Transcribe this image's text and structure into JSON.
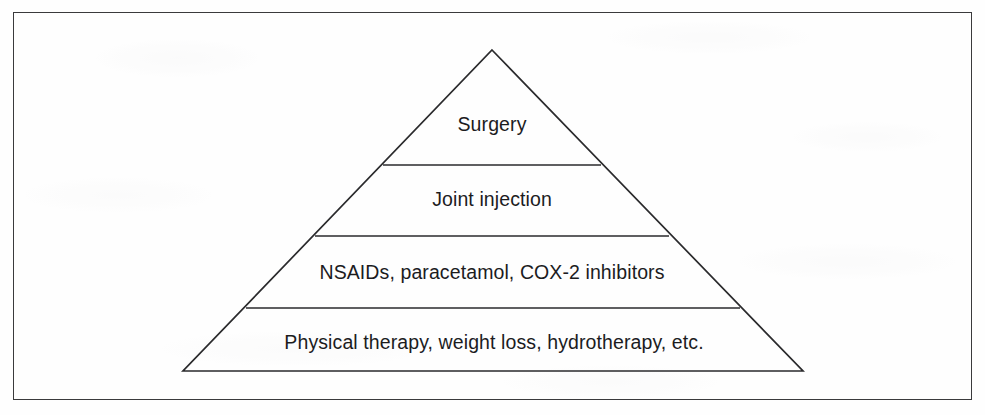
{
  "figure": {
    "type": "pyramid-diagram",
    "orientation": "apex-up",
    "tier_count": 4,
    "border_color": "#3a3a3c",
    "line_color": "#2a2a2c",
    "text_color": "#1c1c1e",
    "background_color": "#fefefe",
    "tiers": [
      {
        "index": 1,
        "position": "top",
        "label": "Surgery"
      },
      {
        "index": 2,
        "position": "upper-middle",
        "label": "Joint injection"
      },
      {
        "index": 3,
        "position": "lower-middle",
        "label": "NSAIDs, paracetamol, COX-2 inhibitors"
      },
      {
        "index": 4,
        "position": "base",
        "label": "Physical therapy, weight loss, hydrotherapy, etc."
      }
    ]
  },
  "geometry": {
    "apex": {
      "x": 492,
      "y": 50
    },
    "base_left": {
      "x": 183,
      "y": 371
    },
    "base_right": {
      "x": 803,
      "y": 371
    },
    "dividers": [
      {
        "y": 165,
        "x_left": 383,
        "x_right": 601
      },
      {
        "y": 236,
        "x_left": 315,
        "x_right": 669
      },
      {
        "y": 308,
        "x_left": 246,
        "x_right": 740
      }
    ],
    "frame": {
      "x": 13,
      "y": 12,
      "width": 959,
      "height": 388
    }
  }
}
